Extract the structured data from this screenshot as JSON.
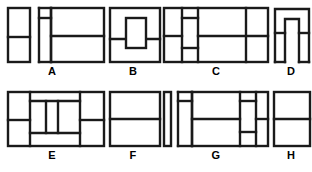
{
  "page": {
    "background_color": "#ffffff",
    "line_color": "#1a1a1a",
    "label_color": "#000000",
    "rows": 2,
    "columns": 4
  },
  "figures": [
    {
      "id": "A",
      "label": "A",
      "row": 1,
      "column": 1,
      "x": 8,
      "y": 6,
      "width": 96,
      "height": 56,
      "description": "Left tall block split horizontally, narrow center column with short stub at top, large right block split horizontally",
      "label_x": 8,
      "label_y": 68
    },
    {
      "id": "B",
      "label": "B",
      "row": 1,
      "column": 2,
      "x": 104,
      "y": 6,
      "width": 58,
      "height": 56,
      "description": "Outer rectangle crossed by a horizontal line with a small inner upright rectangle centered over the line",
      "label_x": 104,
      "label_y": 68
    },
    {
      "id": "C",
      "label": "C",
      "row": 1,
      "column": 3,
      "x": 160,
      "y": 6,
      "width": 110,
      "height": 56,
      "description": "Left narrow column split horizontally, a second narrow column with two stubs, wide middle block split horizontally, right column split horizontally",
      "label_x": 160,
      "label_y": 68
    },
    {
      "id": "D",
      "label": "D",
      "row": 1,
      "column": 4,
      "x": 272,
      "y": 6,
      "width": 36,
      "height": 56,
      "description": "Inverted U arch shape with a horizontal line crossing both legs",
      "label_x": 268,
      "label_y": 68
    },
    {
      "id": "E",
      "label": "E",
      "row": 2,
      "column": 1,
      "x": 8,
      "y": 6,
      "width": 96,
      "height": 56,
      "description": "Left column split horizontally, center block subdivided into three vertical cells with a band above and below, right column split horizontally",
      "label_x": 8,
      "label_y": 68
    },
    {
      "id": "F",
      "label": "F",
      "row": 2,
      "column": 2,
      "x": 104,
      "y": 6,
      "width": 58,
      "height": 56,
      "description": "Plain rectangle divided by one horizontal line",
      "label_x": 104,
      "label_y": 68
    },
    {
      "id": "G",
      "label": "G",
      "row": 2,
      "column": 3,
      "x": 160,
      "y": 6,
      "width": 110,
      "height": 56,
      "description": "Thin vertical bar at far left, narrow column with top stub, wide middle block split horizontally, right column with stacked cells",
      "label_x": 160,
      "label_y": 68
    },
    {
      "id": "H",
      "label": "H",
      "row": 2,
      "column": 4,
      "x": 272,
      "y": 6,
      "width": 38,
      "height": 56,
      "description": "Plain rectangle divided by one horizontal line",
      "label_x": 268,
      "label_y": 68
    }
  ]
}
